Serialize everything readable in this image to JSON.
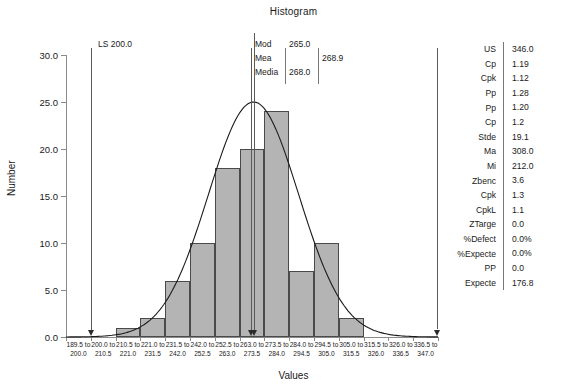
{
  "chart_data": {
    "type": "bar",
    "title": "Histogram",
    "xlabel": "Values",
    "ylabel": "Number",
    "ylim": [
      0,
      30
    ],
    "yticks": [
      "0.0",
      "5.0",
      "10.0",
      "15.0",
      "20.0",
      "25.0",
      "30.0"
    ],
    "ytick_values": [
      0,
      5,
      10,
      15,
      20,
      25,
      30
    ],
    "grid": false,
    "legend": "none",
    "bin_width": 10.5,
    "bin_edges": [
      189.5,
      200.0,
      210.5,
      221.0,
      231.5,
      242.0,
      252.5,
      263.0,
      273.5,
      284.0,
      294.5,
      305.0,
      315.5,
      326.0,
      336.5,
      347.0
    ],
    "categories": [
      "189.5 to 200.0",
      "200.0 to 210.5",
      "210.5 to 221.0",
      "221.0 to 231.5",
      "231.5 to 242.0",
      "242.0 to 252.5",
      "252.5 to 263.0",
      "263.0 to 273.5",
      "273.5 to 284.0",
      "284.0 to 294.5",
      "294.5 to 305.0",
      "305.0 to 315.5",
      "315.5 to 326.0",
      "326.0 to 336.5",
      "336.5 to 347.0"
    ],
    "values": [
      0,
      0,
      1,
      2,
      6,
      10,
      18,
      20,
      24,
      7,
      10,
      2,
      0,
      0,
      0
    ],
    "overlay_curve": {
      "type": "normal",
      "mean": 268.9,
      "sigma": 19.1,
      "peak_value": 25.0
    },
    "annotations": [
      {
        "name": "LSL",
        "label": "LS",
        "value": "200.0",
        "x": 200.0
      },
      {
        "name": "Median",
        "label": "Media",
        "value": "268.0",
        "x": 268.0
      },
      {
        "name": "Mean",
        "label": "Mea",
        "value": "268.9",
        "x": 268.9
      },
      {
        "name": "Mode",
        "label": "Mod",
        "value": "265.0",
        "x": 265.0
      },
      {
        "name": "USL",
        "label": "US",
        "value": "346.0",
        "x": 346.0
      }
    ]
  },
  "chart": {
    "title": "Histogram",
    "ylabel": "Number",
    "xlabel": "Values"
  },
  "center_annotations": {
    "mode_label": "Mod",
    "mode_value": "265.0",
    "mean_label": "Mea",
    "mean_value": "268.9",
    "median_label": "Media",
    "median_value": "268.0"
  },
  "lsl_annotation": {
    "label": "LS 200.0"
  },
  "stats": {
    "rows": [
      {
        "label": "US",
        "value": "346.0"
      },
      {
        "label": "Cp",
        "value": "1.19"
      },
      {
        "label": "Cpk",
        "value": "1.12"
      },
      {
        "label": "Pp",
        "value": "1.28"
      },
      {
        "label": "Pp",
        "value": "1.20"
      },
      {
        "label": "Cp",
        "value": "1.2"
      },
      {
        "label": "Stde",
        "value": "19.1"
      },
      {
        "label": "Ma",
        "value": "308.0"
      },
      {
        "label": "Mi",
        "value": "212.0"
      },
      {
        "label": "Zbenc",
        "value": "3.6"
      },
      {
        "label": "Cpk",
        "value": "1.3"
      },
      {
        "label": "CpkL",
        "value": "1.1"
      },
      {
        "label": "ZTarge",
        "value": "0.0"
      },
      {
        "label": "%Defect",
        "value": "0.0%"
      },
      {
        "label": "%Expecte",
        "value": "0.0%"
      },
      {
        "label": "PP",
        "value": "0.0"
      },
      {
        "label": "Expecte",
        "value": "176.8"
      }
    ]
  },
  "colors": {
    "bar_fill": "#b4b4b4",
    "bar_stroke": "#4a4a4a",
    "axis": "#8a8a8a",
    "curve": "#1a1a1a",
    "text": "#1a1a1a"
  }
}
